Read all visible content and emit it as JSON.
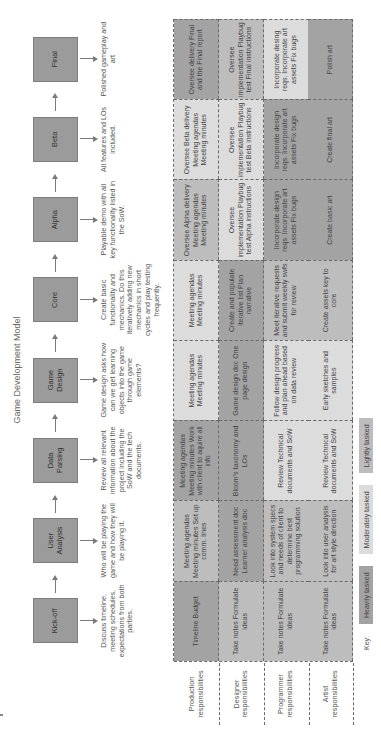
{
  "title": "Game Development Model",
  "stages": [
    {
      "label": "Kick-off",
      "description": "Discuss timeline, meeting schedules, expectations from both parties."
    },
    {
      "label": "User Analysis",
      "description": "Who will be playing the game and how they will be playing it."
    },
    {
      "label": "Data Parsing",
      "description": "Review all relevant information about the project including the SoW and the tech documents."
    },
    {
      "label": "Game Design",
      "description": "Game design asks how can we get learning objects into the game through game elements?"
    },
    {
      "label": "Core",
      "description": "Create basic functionality and mechanics. Do this iteratively adding new mechanics in short cycles and play testing frequently."
    },
    {
      "label": "Alpha",
      "description": "Playable demo with all key functionality listed in the SoW."
    },
    {
      "label": "Beta",
      "description": "All features and LOs included."
    },
    {
      "label": "Final",
      "description": "Polished gameplay and art"
    }
  ],
  "roles": [
    {
      "label": "Production responsibilities",
      "cells": [
        {
          "text": "Timeline Budget",
          "level": "heavy"
        },
        {
          "text": "Meeting agendas Meeting minutes Set up comm. lines",
          "level": "light"
        },
        {
          "text": "Meeting agendas Meeting minutes Work with client to aquire all info",
          "level": "heavy"
        },
        {
          "text": "Meeting agendas Meeting minutes",
          "level": "moderate"
        },
        {
          "text": "Meeting agendas Meeting minutes",
          "level": "moderate"
        },
        {
          "text": "Oversee Alpha delivery Meeting agendas Meeting minutes",
          "level": "light"
        },
        {
          "text": "Oversee Beta delivery Meeting agendas Meeting minutes",
          "level": "moderate"
        },
        {
          "text": "Oversee delivery Final and the Final report",
          "level": "heavy"
        }
      ]
    },
    {
      "label": "Designer responsibilities",
      "cells": [
        {
          "text": "Take notes Formulate ideas",
          "level": "light"
        },
        {
          "text": "Need assessment doc Learner analysis doc",
          "level": "heavy"
        },
        {
          "text": "Bloom's taxonomy and LOs",
          "level": "heavy"
        },
        {
          "text": "Game design doc One page design",
          "level": "heavy"
        },
        {
          "text": "Create and populate iterative list Plan narrative",
          "level": "heavy"
        },
        {
          "text": "Oversee implementation Playbug test Alpha instructions",
          "level": "moderate"
        },
        {
          "text": "Oversee implementation Playbug test Beta instructions",
          "level": "moderate"
        },
        {
          "text": "Oversee implementation Playbug test Final instructions",
          "level": "light"
        }
      ]
    },
    {
      "label": "Programmer responsibilities",
      "cells": [
        {
          "text": "Take notes Formulate ideas",
          "level": "light"
        },
        {
          "text": "Look into system specs and needs of client to determine best programming solution",
          "level": "light"
        },
        {
          "text": "Review Technical documents and SoW",
          "level": "moderate"
        },
        {
          "text": "Follow design progress and plan ahead based on data review",
          "level": "moderate"
        },
        {
          "text": "Meet iterative requests and submit weekly swfs for review",
          "level": "light"
        },
        {
          "text": "Incorporate design reqs. Incorporate art assets Fix bugs",
          "level": "heavy"
        },
        {
          "text": "Incorporate design reqs. Incorporate art assets Fix bugs",
          "level": "heavy"
        },
        {
          "text": "Incorporate desing reqs. Incorporate art assets Fix bugs",
          "level": "moderate"
        }
      ]
    },
    {
      "label": "Artist responsibilities",
      "cells": [
        {
          "text": "Take notes Formulate ideas",
          "level": "light"
        },
        {
          "text": "Look into user analysis for art style direction",
          "level": "light"
        },
        {
          "text": "Review Technical documents and SoW",
          "level": "moderate"
        },
        {
          "text": "Early sketches and samples",
          "level": "moderate"
        },
        {
          "text": "Create assets key to core",
          "level": "light"
        },
        {
          "text": "Create basic art",
          "level": "heavy"
        },
        {
          "text": "Create final art",
          "level": "heavy"
        },
        {
          "text": "Polish art",
          "level": "heavy"
        }
      ]
    }
  ],
  "key": {
    "label": "Key:",
    "items": [
      {
        "label": "Heavily tasked",
        "color": "#a3a3a3"
      },
      {
        "label": "Moderately tasked",
        "color": "#dcdcdc"
      },
      {
        "label": "Lightly tasked",
        "color": "#bdbdbd"
      }
    ]
  }
}
